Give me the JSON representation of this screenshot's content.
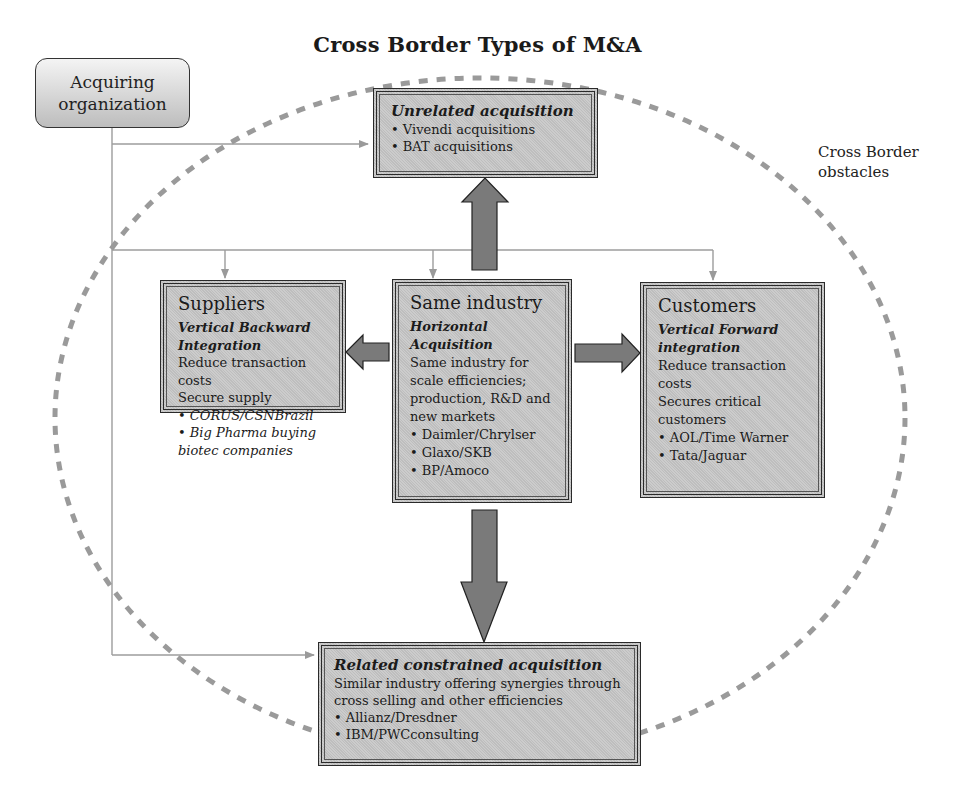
{
  "title": "Cross Border Types of M&A",
  "acquiring_org": {
    "line1": "Acquiring",
    "line2": "organization"
  },
  "obstacles": {
    "line1": "Cross Border",
    "line2": "obstacles"
  },
  "unrelated": {
    "heading": "Unrelated acquisition",
    "items": [
      "Vivendi acquisitions",
      "BAT acquisitions"
    ]
  },
  "suppliers": {
    "heading": "Suppliers",
    "subheading_line1": "Vertical Backward",
    "subheading_line2": "Integration",
    "text1": "Reduce transaction costs",
    "text2": "Secure supply",
    "items": [
      "CORUS/CSNBrazil",
      "Big Pharma buying biotec companies"
    ]
  },
  "same_industry": {
    "heading": "Same industry",
    "subheading_line1": "Horizontal",
    "subheading_line2": "Acquisition",
    "text1": "Same industry for scale efficiencies; production, R&D and new markets",
    "items": [
      "Daimler/Chrylser",
      "Glaxo/SKB",
      "BP/Amoco"
    ]
  },
  "customers": {
    "heading": "Customers",
    "subheading_line1": "Vertical Forward",
    "subheading_line2": "integration",
    "text1": "Reduce transaction costs",
    "text2": "Secures critical customers",
    "items": [
      "AOL/Time Warner",
      "Tata/Jaguar"
    ]
  },
  "related": {
    "heading": "Related constrained acquisition",
    "text1": "Similar industry offering synergies through cross selling and other efficiencies",
    "items": [
      "Allianz/Dresdner",
      "IBM/PWCconsulting"
    ]
  },
  "colors": {
    "box_fill": "#c6c6c6",
    "box_border": "#2a2a2a",
    "arrow_fill": "#7a7a7a",
    "connector": "#999999",
    "ellipse_dash": "#9a9a9a"
  }
}
